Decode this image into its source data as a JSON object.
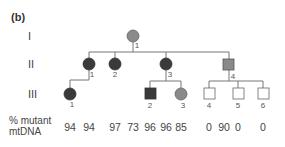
{
  "panel_label": "(b)",
  "generations": [
    "I",
    "II",
    "III"
  ],
  "row_label_line1": "% mutant",
  "row_label_line2": "mtDNA",
  "colors": {
    "affected_dark": "#3a3a3a",
    "affected_medium": "#8a8a8a",
    "unaffected": "#ffffff",
    "line": "#666666"
  },
  "individuals": {
    "I-1": {
      "sex": "female",
      "shade": "medium",
      "number": "1"
    },
    "II-1": {
      "sex": "female",
      "shade": "dark",
      "number": "1"
    },
    "II-2": {
      "sex": "female",
      "shade": "dark",
      "number": "2"
    },
    "II-3": {
      "sex": "female",
      "shade": "dark",
      "number": "3"
    },
    "II-4": {
      "sex": "male",
      "shade": "medium",
      "number": "4"
    },
    "III-1": {
      "sex": "female",
      "shade": "dark",
      "number": "1"
    },
    "III-2": {
      "sex": "male",
      "shade": "dark",
      "number": "2"
    },
    "III-3": {
      "sex": "female",
      "shade": "medium",
      "number": "3"
    },
    "III-4": {
      "sex": "male",
      "shade": "none",
      "number": "4"
    },
    "III-5": {
      "sex": "male",
      "shade": "none",
      "number": "5"
    },
    "III-6": {
      "sex": "male",
      "shade": "none",
      "number": "6"
    }
  },
  "mutant_values": [
    "94",
    "94",
    "97",
    "73",
    "96",
    "96",
    "85",
    "0",
    "90",
    "0",
    "0"
  ]
}
